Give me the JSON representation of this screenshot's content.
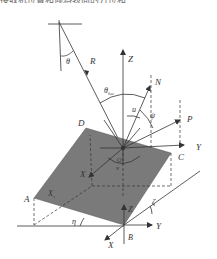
{
  "caption_fragment": "接收机位置和倾斜表面的方位和",
  "labels": {
    "R": "R",
    "theta": "θ",
    "theta_loc": "θ",
    "theta_loc_sub": "loc",
    "Z_top": "Z",
    "N": "N",
    "u": "u",
    "psi": "ψ",
    "P": "P",
    "Y_mid": "Y",
    "D": "D",
    "C": "C",
    "X_mid": "X",
    "A": "A",
    "Xs": "X",
    "Xs_sub": "s",
    "eta": "η",
    "zeta": "ζ",
    "Z_bottom": "Z",
    "Y_bottom": "Y",
    "B": "B",
    "X_bottom": "X",
    "v": "v",
    "O": "O"
  },
  "colors": {
    "plane_fill": "#7a7a7a",
    "line": "#333333",
    "background": "#ffffff"
  }
}
